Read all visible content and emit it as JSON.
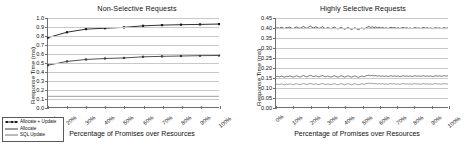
{
  "figure": {
    "width": 460,
    "height": 151,
    "background": "#ffffff"
  },
  "legend": {
    "position": "bottom-left",
    "items": [
      {
        "label": "Allocate + Update",
        "color": "#1a1a1a",
        "marker": "square"
      },
      {
        "label": "Allocate",
        "color": "#3d3d3d",
        "marker": "none"
      },
      {
        "label": "SQL Update",
        "color": "#777777",
        "marker": "none"
      }
    ]
  },
  "chart_data": [
    {
      "type": "line",
      "panel": "left",
      "title": "Non-Selective Requests",
      "xlabel": "Percentage of Promises over Resources",
      "ylabel": "Response Time (ms)",
      "grid": true,
      "legend_position": "outside-bottom-left",
      "xlim": [
        10,
        100
      ],
      "ylim": [
        0.0,
        1.0
      ],
      "ytick_labels": [
        "0.0",
        "0.1",
        "0.2",
        "0.3",
        "0.4",
        "0.5",
        "0.6",
        "0.7",
        "0.8",
        "0.9",
        "1.0"
      ],
      "ytick_values": [
        0.0,
        0.1,
        0.2,
        0.3,
        0.4,
        0.5,
        0.6,
        0.7,
        0.8,
        0.9,
        1.0
      ],
      "xtick_labels": [
        "10%",
        "20%",
        "30%",
        "40%",
        "50%",
        "60%",
        "70%",
        "80%",
        "90%",
        "100%"
      ],
      "x": [
        10,
        20,
        30,
        40,
        50,
        60,
        70,
        80,
        90,
        100
      ],
      "series": [
        {
          "name": "Allocate + Update",
          "color": "#1a1a1a",
          "marker": "square",
          "values": [
            0.78,
            0.84,
            0.875,
            0.885,
            0.895,
            0.912,
            0.92,
            0.925,
            0.928,
            0.932
          ]
        },
        {
          "name": "Allocate",
          "color": "#3d3d3d",
          "marker": "square",
          "values": [
            0.47,
            0.512,
            0.534,
            0.545,
            0.551,
            0.564,
            0.569,
            0.573,
            0.577,
            0.579
          ]
        },
        {
          "name": "SQL Update",
          "color": "#777777",
          "marker": "none",
          "values": [
            0.12,
            0.12,
            0.12,
            0.12,
            0.12,
            0.12,
            0.12,
            0.12,
            0.12,
            0.12
          ]
        }
      ]
    },
    {
      "type": "line",
      "panel": "right",
      "title": "Highly Selective Requests",
      "xlabel": "Percentage of Promises over Resources",
      "ylabel": "Response Time (ms)",
      "grid": true,
      "legend_position": "none",
      "xlim": [
        0,
        100
      ],
      "ylim": [
        0.0,
        0.45
      ],
      "ytick_labels": [
        "0.00",
        "0.05",
        "0.10",
        "0.15",
        "0.20",
        "0.25",
        "0.30",
        "0.35",
        "0.40",
        "0.45"
      ],
      "ytick_values": [
        0.0,
        0.05,
        0.1,
        0.15,
        0.2,
        0.25,
        0.3,
        0.35,
        0.4,
        0.45
      ],
      "xtick_labels": [
        "0%",
        "10%",
        "20%",
        "30%",
        "40%",
        "50%",
        "60%",
        "70%",
        "80%",
        "90%",
        "100%"
      ],
      "x": [
        0,
        1,
        2,
        3,
        4,
        5,
        6,
        7,
        8,
        9,
        10,
        11,
        12,
        13,
        14,
        15,
        16,
        17,
        18,
        19,
        20,
        21,
        22,
        23,
        24,
        25,
        26,
        27,
        28,
        29,
        30,
        31,
        32,
        33,
        34,
        35,
        36,
        37,
        38,
        39,
        40,
        41,
        42,
        43,
        44,
        45,
        46,
        47,
        48,
        49,
        50,
        51,
        52,
        53,
        54,
        55,
        56,
        57,
        58,
        59,
        60,
        61,
        62,
        63,
        64,
        65,
        66,
        67,
        68,
        69,
        70,
        71,
        72,
        73,
        74,
        75,
        76,
        77,
        78,
        79,
        80,
        81,
        82,
        83,
        84,
        85,
        86,
        87,
        88,
        89,
        90,
        91,
        92,
        93,
        94,
        95,
        96,
        97,
        98,
        99,
        100
      ],
      "series": [
        {
          "name": "Allocate + Update",
          "color": "#1a1a1a",
          "marker": "none",
          "values": [
            0.399,
            0.401,
            0.398,
            0.403,
            0.4,
            0.397,
            0.402,
            0.4,
            0.404,
            0.399,
            0.396,
            0.401,
            0.405,
            0.4,
            0.398,
            0.403,
            0.407,
            0.401,
            0.398,
            0.404,
            0.409,
            0.403,
            0.399,
            0.405,
            0.402,
            0.397,
            0.401,
            0.406,
            0.4,
            0.396,
            0.402,
            0.399,
            0.395,
            0.4,
            0.404,
            0.398,
            0.394,
            0.399,
            0.403,
            0.397,
            0.393,
            0.398,
            0.402,
            0.396,
            0.392,
            0.397,
            0.401,
            0.395,
            0.391,
            0.396,
            0.4,
            0.394,
            0.398,
            0.403,
            0.407,
            0.402,
            0.406,
            0.401,
            0.405,
            0.4,
            0.403,
            0.399,
            0.402,
            0.398,
            0.401,
            0.397,
            0.4,
            0.403,
            0.399,
            0.402,
            0.398,
            0.401,
            0.397,
            0.4,
            0.402,
            0.398,
            0.401,
            0.397,
            0.4,
            0.396,
            0.399,
            0.402,
            0.398,
            0.4,
            0.397,
            0.4,
            0.402,
            0.398,
            0.401,
            0.397,
            0.4,
            0.396,
            0.399,
            0.401,
            0.398,
            0.4,
            0.397,
            0.399,
            0.401,
            0.398,
            0.4
          ]
        },
        {
          "name": "Allocate",
          "color": "#3d3d3d",
          "marker": "none",
          "values": [
            0.153,
            0.155,
            0.152,
            0.156,
            0.154,
            0.151,
            0.155,
            0.153,
            0.157,
            0.154,
            0.151,
            0.155,
            0.158,
            0.154,
            0.152,
            0.156,
            0.159,
            0.155,
            0.152,
            0.157,
            0.16,
            0.156,
            0.153,
            0.158,
            0.155,
            0.152,
            0.156,
            0.159,
            0.155,
            0.152,
            0.157,
            0.154,
            0.151,
            0.155,
            0.158,
            0.154,
            0.151,
            0.155,
            0.158,
            0.154,
            0.151,
            0.155,
            0.158,
            0.154,
            0.151,
            0.155,
            0.157,
            0.153,
            0.15,
            0.154,
            0.157,
            0.153,
            0.156,
            0.159,
            0.161,
            0.158,
            0.16,
            0.157,
            0.159,
            0.156,
            0.158,
            0.155,
            0.157,
            0.155,
            0.157,
            0.154,
            0.156,
            0.158,
            0.155,
            0.157,
            0.155,
            0.157,
            0.154,
            0.156,
            0.158,
            0.155,
            0.157,
            0.155,
            0.157,
            0.154,
            0.156,
            0.158,
            0.155,
            0.157,
            0.155,
            0.157,
            0.158,
            0.155,
            0.157,
            0.155,
            0.157,
            0.154,
            0.156,
            0.158,
            0.156,
            0.157,
            0.155,
            0.157,
            0.158,
            0.156,
            0.158
          ]
        },
        {
          "name": "SQL Update",
          "color": "#777777",
          "marker": "none",
          "values": [
            0.114,
            0.116,
            0.113,
            0.117,
            0.115,
            0.112,
            0.116,
            0.114,
            0.117,
            0.115,
            0.112,
            0.116,
            0.118,
            0.115,
            0.113,
            0.116,
            0.119,
            0.116,
            0.113,
            0.117,
            0.119,
            0.116,
            0.114,
            0.118,
            0.115,
            0.113,
            0.116,
            0.119,
            0.116,
            0.113,
            0.117,
            0.115,
            0.112,
            0.116,
            0.118,
            0.115,
            0.112,
            0.116,
            0.118,
            0.115,
            0.112,
            0.116,
            0.118,
            0.115,
            0.112,
            0.116,
            0.118,
            0.114,
            0.112,
            0.115,
            0.118,
            0.114,
            0.117,
            0.119,
            0.121,
            0.118,
            0.12,
            0.117,
            0.119,
            0.116,
            0.118,
            0.116,
            0.118,
            0.115,
            0.117,
            0.115,
            0.117,
            0.118,
            0.116,
            0.118,
            0.115,
            0.117,
            0.115,
            0.117,
            0.118,
            0.116,
            0.117,
            0.115,
            0.117,
            0.115,
            0.117,
            0.118,
            0.116,
            0.117,
            0.115,
            0.117,
            0.118,
            0.116,
            0.117,
            0.115,
            0.117,
            0.115,
            0.117,
            0.118,
            0.116,
            0.117,
            0.115,
            0.117,
            0.118,
            0.116,
            0.117
          ]
        }
      ]
    }
  ]
}
